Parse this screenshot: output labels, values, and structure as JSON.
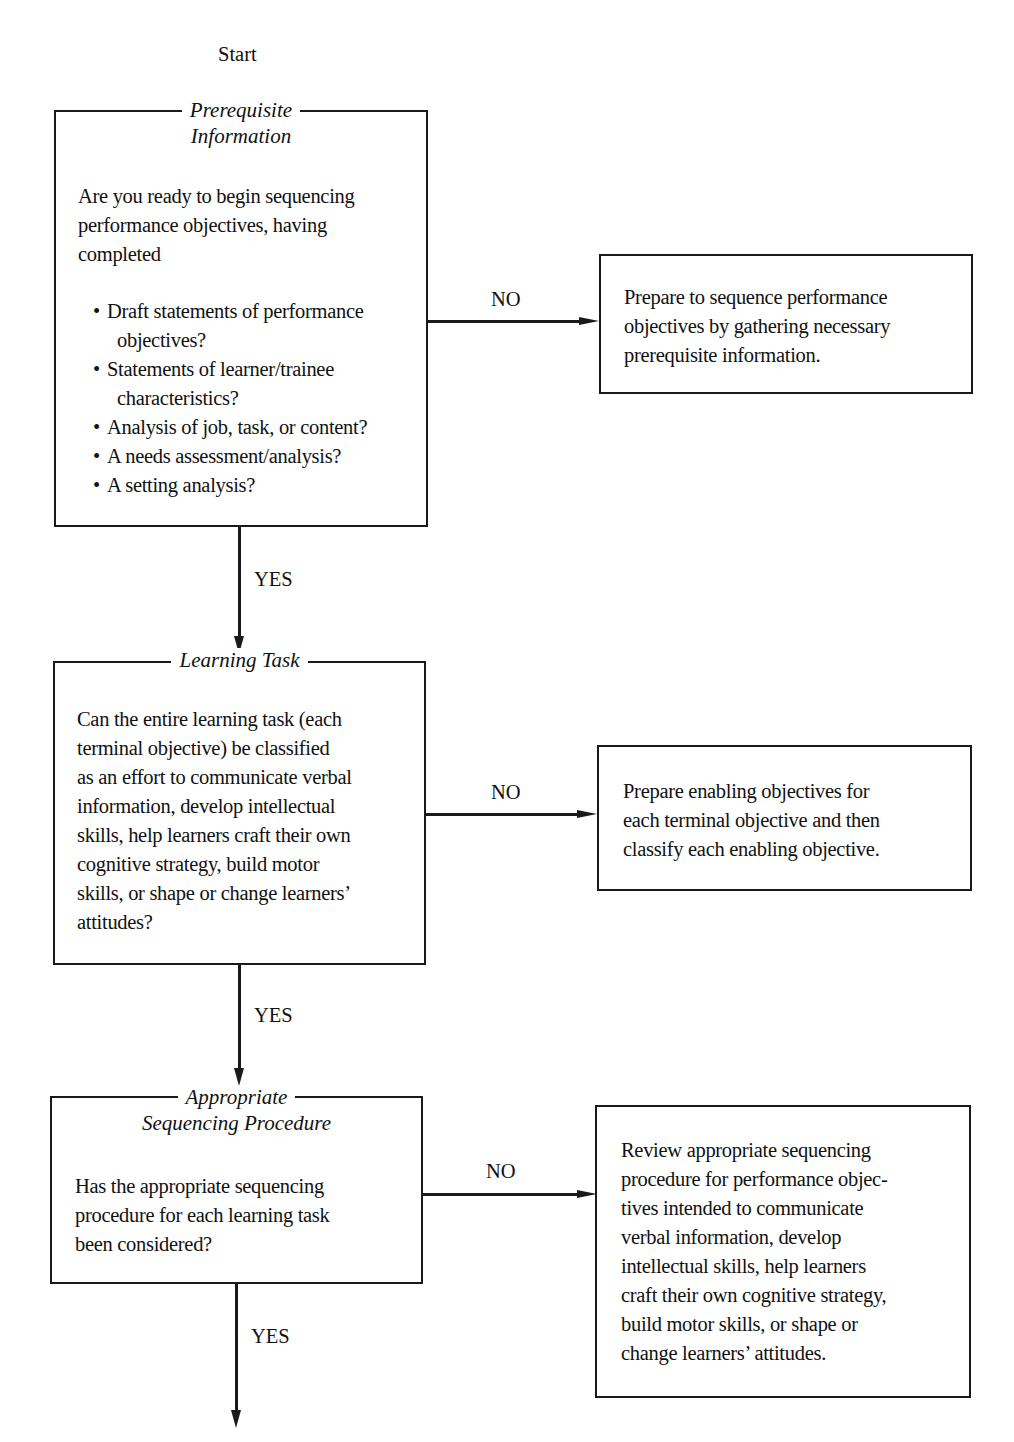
{
  "start_label": "Start",
  "steps": [
    {
      "title_lines": [
        "Prerequisite",
        "Information"
      ],
      "question_lines": [
        "Are you ready to begin sequencing",
        "performance objectives, having",
        "completed"
      ],
      "bullets": [
        [
          "Draft statements of performance",
          "objectives?"
        ],
        [
          "Statements of learner/trainee",
          "characteristics?"
        ],
        [
          "Analysis of job, task, or content?"
        ],
        [
          "A needs assessment/analysis?"
        ],
        [
          "A setting analysis?"
        ]
      ],
      "no_label": "NO",
      "yes_label": "YES",
      "no_action_lines": [
        "Prepare to sequence performance",
        "objectives by gathering necessary",
        "prerequisite information."
      ]
    },
    {
      "title_lines": [
        "Learning Task"
      ],
      "question_lines": [
        "Can the entire learning task (each",
        "terminal objective) be classified",
        "as an effort to communicate verbal",
        "information, develop intellectual",
        "skills, help learners craft their own",
        "cognitive strategy, build motor",
        "skills, or shape or change learners’",
        "attitudes?"
      ],
      "no_label": "NO",
      "yes_label": "YES",
      "no_action_lines": [
        "Prepare enabling objectives for",
        "each terminal objective and then",
        "classify each enabling objective."
      ]
    },
    {
      "title_lines": [
        "Appropriate",
        "Sequencing Procedure"
      ],
      "question_lines": [
        "Has the appropriate sequencing",
        "procedure for each learning task",
        "been considered?"
      ],
      "no_label": "NO",
      "yes_label": "YES",
      "no_action_lines": [
        "Review appropriate sequencing",
        "procedure for performance objec-",
        "tives intended to communicate",
        "verbal information, develop",
        "intellectual skills, help learners",
        "craft their own cognitive strategy,",
        "build motor skills, or shape or",
        "change learners’ attitudes."
      ]
    }
  ]
}
